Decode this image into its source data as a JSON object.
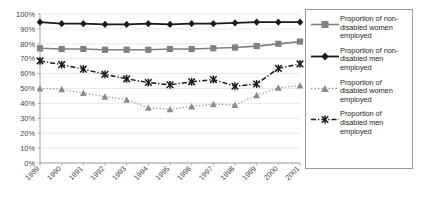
{
  "chart_data": {
    "type": "line",
    "title": "",
    "xlabel": "",
    "ylabel": "",
    "ylim": [
      0,
      100
    ],
    "yticks": [
      "0%",
      "10%",
      "20%",
      "30%",
      "40%",
      "50%",
      "60%",
      "70%",
      "80%",
      "90%",
      "100%"
    ],
    "grid": true,
    "legend_position": "right",
    "categories": [
      "1989",
      "1990",
      "1991",
      "1992",
      "1993",
      "1994",
      "1995",
      "1996",
      "1997",
      "1998",
      "1999",
      "2000",
      "2001"
    ],
    "series": [
      {
        "name": "Proportion of non-disabled women employed",
        "key": "non-disabled-women",
        "color": "#808080",
        "marker": "square",
        "dash": "solid",
        "values": [
          77,
          76.5,
          76.5,
          76,
          76,
          76,
          76.5,
          76.5,
          77,
          77.5,
          78.5,
          80,
          81.5
        ]
      },
      {
        "name": "Proportion of non-disabled men employed",
        "key": "non-disabled-men",
        "color": "#1a1a1a",
        "marker": "diamond",
        "dash": "solid",
        "values": [
          94.5,
          93.5,
          93.5,
          93,
          93,
          93.5,
          93,
          93.5,
          93.5,
          94,
          94.5,
          94.5,
          94.5
        ]
      },
      {
        "name": "Proportion of disabled women employed",
        "key": "disabled-women",
        "color": "#8c8c8c",
        "marker": "triangle",
        "dash": "dotted",
        "values": [
          50,
          49.5,
          47,
          44.5,
          42.5,
          37,
          36,
          38,
          39.5,
          39,
          45.5,
          50.5,
          52
        ]
      },
      {
        "name": "Proportion of disabled men employed",
        "key": "disabled-men",
        "color": "#1a1a1a",
        "marker": "star",
        "dash": "dashdot",
        "values": [
          68.5,
          66,
          63,
          59.5,
          56.5,
          54,
          52.5,
          54.5,
          56,
          51.5,
          53,
          63.5,
          66.5
        ]
      }
    ]
  },
  "legend": {
    "items": [
      {
        "label": "Proportion of non-disabled women employed",
        "key": "non-disabled-women"
      },
      {
        "label": "Proportion of non-disabled men employed",
        "key": "non-disabled-men"
      },
      {
        "label": "Proportion of disabled women employed",
        "key": "disabled-women"
      },
      {
        "label": "Proportion of disabled men employed",
        "key": "disabled-men"
      }
    ]
  }
}
